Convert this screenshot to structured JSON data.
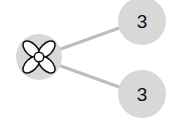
{
  "diagram": {
    "center_node": {
      "icon": "flower-icon"
    },
    "child_nodes": [
      {
        "label": "3"
      },
      {
        "label": "3"
      }
    ],
    "colors": {
      "node_fill": "#d8d8d8",
      "edge": "#bcbcbc",
      "text": "#111111"
    }
  }
}
